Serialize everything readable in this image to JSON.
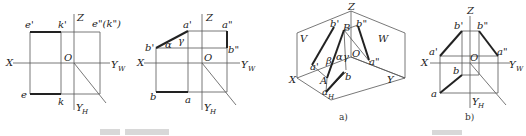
{
  "figure1": {
    "labels": {
      "e_prime": "e'",
      "k_prime": "k'",
      "Z": "Z",
      "e_dd_k_dd": "e\"(k\")",
      "X": "X",
      "O": "O",
      "Yw": "Y",
      "Yw_sub": "W",
      "e": "e",
      "k": "k",
      "Yh": "Y",
      "Yh_sub": "H"
    }
  },
  "figure2": {
    "labels": {
      "a_prime": "a'",
      "Z": "Z",
      "a_dd": "a\"",
      "b_prime": "b'",
      "alpha": "α",
      "gamma": "γ",
      "b_dd": "b\"",
      "X": "X",
      "O": "O",
      "Yw": "Y",
      "Yw_sub": "W",
      "b": "b",
      "a": "a",
      "Yh": "Y",
      "Yh_sub": "H"
    }
  },
  "figure3": {
    "caption": "a)",
    "labels": {
      "Z": "Z",
      "b_prime": "b'",
      "B": "B",
      "b_dd": "b\"",
      "V": "V",
      "W": "W",
      "beta": "β",
      "alpha": "α",
      "gamma": "γ",
      "O": "O",
      "a_prime": "a'",
      "a_dd": "a\"",
      "X": "X",
      "A": "A",
      "b": "b",
      "a": "a",
      "H": "H",
      "Y": "Y"
    }
  },
  "figure4": {
    "caption": "b)",
    "labels": {
      "Z": "Z",
      "b_prime": "b'",
      "b_dd": "b\"",
      "a_prime": "a'",
      "a_dd": "a\"",
      "X": "X",
      "O": "O",
      "Yw": "Y",
      "Yw_sub": "W",
      "b": "b",
      "a": "a",
      "Yh": "Y",
      "Yh_sub": "H"
    }
  }
}
